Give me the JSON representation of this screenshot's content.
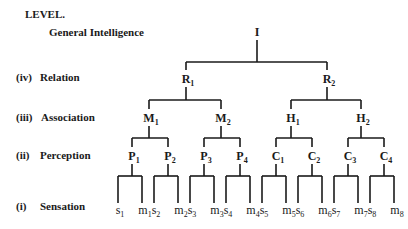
{
  "header": {
    "level_title": "LEVEL.",
    "root_label": "General Intelligence"
  },
  "levels": [
    {
      "num": "(iv)",
      "name": "Relation"
    },
    {
      "num": "(iii)",
      "name": "Association"
    },
    {
      "num": "(ii)",
      "name": "Perception"
    },
    {
      "num": "(i)",
      "name": "Sensation"
    }
  ],
  "tree": {
    "root": "I",
    "relation": [
      {
        "base": "R",
        "sub": "1"
      },
      {
        "base": "R",
        "sub": "2"
      }
    ],
    "association": [
      {
        "base": "M",
        "sub": "1"
      },
      {
        "base": "M",
        "sub": "2"
      },
      {
        "base": "H",
        "sub": "1"
      },
      {
        "base": "H",
        "sub": "2"
      }
    ],
    "perception": [
      {
        "base": "P",
        "sub": "1"
      },
      {
        "base": "P",
        "sub": "2"
      },
      {
        "base": "P",
        "sub": "3"
      },
      {
        "base": "P",
        "sub": "4"
      },
      {
        "base": "C",
        "sub": "1"
      },
      {
        "base": "C",
        "sub": "2"
      },
      {
        "base": "C",
        "sub": "3"
      },
      {
        "base": "C",
        "sub": "4"
      }
    ],
    "sensation": [
      {
        "base": "s",
        "sub": "1"
      },
      {
        "base": "m",
        "sub": "1"
      },
      {
        "base": "s",
        "sub": "2"
      },
      {
        "base": "m",
        "sub": "2"
      },
      {
        "base": "s",
        "sub": "3"
      },
      {
        "base": "m",
        "sub": "3"
      },
      {
        "base": "s",
        "sub": "4"
      },
      {
        "base": "m",
        "sub": "4"
      },
      {
        "base": "s",
        "sub": "5"
      },
      {
        "base": "m",
        "sub": "5"
      },
      {
        "base": "s",
        "sub": "6"
      },
      {
        "base": "m",
        "sub": "6"
      },
      {
        "base": "s",
        "sub": "7"
      },
      {
        "base": "m",
        "sub": "7"
      },
      {
        "base": "s",
        "sub": "8"
      },
      {
        "base": "m",
        "sub": "8"
      }
    ]
  }
}
